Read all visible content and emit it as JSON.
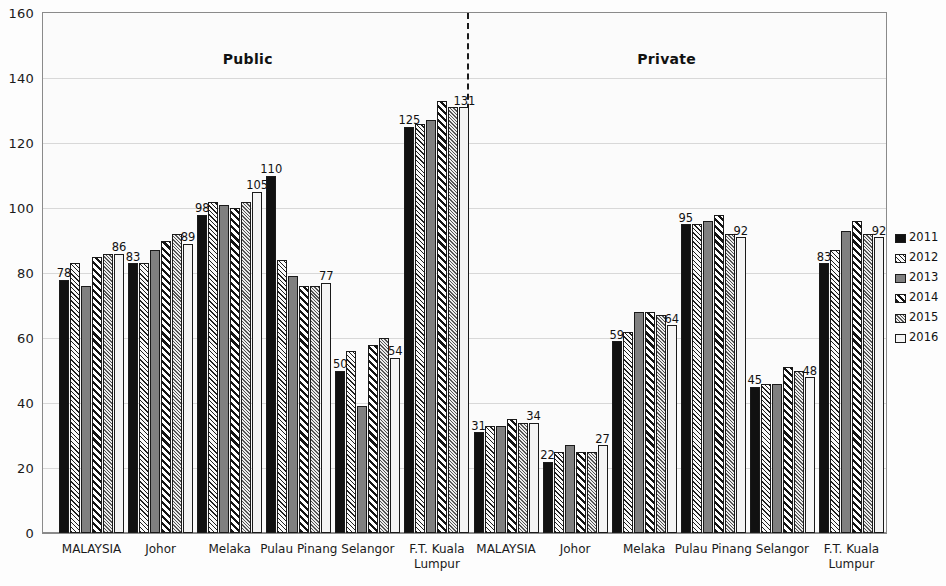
{
  "chart_data": {
    "type": "bar",
    "title": "",
    "xlabel": "",
    "ylabel": "",
    "ylim": [
      0,
      160
    ],
    "ytick_step": 20,
    "yticks": [
      "160",
      "140",
      "120",
      "100",
      "80",
      "60",
      "40",
      "20",
      "0"
    ],
    "grid": true,
    "legend_position": "right",
    "sections": [
      {
        "name": "Public"
      },
      {
        "name": "Private"
      }
    ],
    "categories": [
      "MALAYSIA",
      "Johor",
      "Melaka",
      "Pulau Pinang",
      "Selangor",
      "F.T. Kuala\nLumpur"
    ],
    "series_names": [
      "2011",
      "2012",
      "2013",
      "2014",
      "2015",
      "2016"
    ],
    "panels": [
      {
        "section": "Public",
        "groups": [
          {
            "category": "MALAYSIA",
            "values": [
              78,
              83,
              76,
              85,
              86,
              86
            ],
            "annotations": {
              "first": "78",
              "last": "86"
            }
          },
          {
            "category": "Johor",
            "values": [
              83,
              83,
              87,
              90,
              92,
              89
            ],
            "annotations": {
              "first": "83",
              "last": "89"
            }
          },
          {
            "category": "Melaka",
            "values": [
              98,
              102,
              101,
              100,
              102,
              105
            ],
            "annotations": {
              "first": "98",
              "last": "105"
            }
          },
          {
            "category": "Pulau Pinang",
            "values": [
              110,
              84,
              79,
              76,
              76,
              77
            ],
            "annotations": {
              "first": "110",
              "last": "77"
            }
          },
          {
            "category": "Selangor",
            "values": [
              50,
              56,
              39,
              58,
              60,
              54
            ],
            "annotations": {
              "first": "50",
              "last": "54"
            }
          },
          {
            "category": "F.T. Kuala\nLumpur",
            "values": [
              125,
              126,
              127,
              133,
              131,
              131
            ],
            "annotations": {
              "first": "125",
              "last": "131"
            }
          }
        ]
      },
      {
        "section": "Private",
        "groups": [
          {
            "category": "MALAYSIA",
            "values": [
              31,
              33,
              33,
              35,
              34,
              34
            ],
            "annotations": {
              "first": "31",
              "last": "34"
            }
          },
          {
            "category": "Johor",
            "values": [
              22,
              25,
              27,
              25,
              25,
              27
            ],
            "annotations": {
              "first": "22",
              "last": "27"
            }
          },
          {
            "category": "Melaka",
            "values": [
              59,
              62,
              68,
              68,
              67,
              64
            ],
            "annotations": {
              "first": "59",
              "last": "64"
            }
          },
          {
            "category": "Pulau Pinang",
            "values": [
              95,
              95,
              96,
              98,
              92,
              91
            ],
            "annotations": {
              "first": "95",
              "last": "92"
            }
          },
          {
            "category": "Selangor",
            "values": [
              45,
              46,
              46,
              51,
              50,
              48
            ],
            "annotations": {
              "first": "45",
              "last": "48"
            }
          },
          {
            "category": "F.T. Kuala\nLumpur",
            "values": [
              83,
              87,
              93,
              96,
              92,
              91
            ],
            "annotations": {
              "first": "83",
              "last": "92"
            }
          }
        ]
      }
    ],
    "colors": {
      "axis": "#8a8a8a",
      "grid": "#d8d8d8",
      "text": "#1a1a1a",
      "divider": "#1a1a1a",
      "series": [
        "#111111",
        "#1f1f1f",
        "#808080",
        "#141414",
        "#555555",
        "#f4f4f4"
      ]
    }
  },
  "legend": {
    "items": [
      {
        "label": "2011"
      },
      {
        "label": "2012"
      },
      {
        "label": "2013"
      },
      {
        "label": "2014"
      },
      {
        "label": "2015"
      },
      {
        "label": "2016"
      }
    ]
  }
}
